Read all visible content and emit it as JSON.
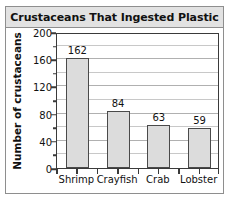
{
  "chart_data": {
    "type": "bar",
    "title": "Crustaceans That Ingested Plastic",
    "xlabel": "",
    "ylabel": "Number of crustaceans",
    "categories": [
      "Shrimp",
      "Crayfish",
      "Crab",
      "Lobster"
    ],
    "values": [
      162,
      84,
      63,
      59
    ],
    "value_labels": [
      "162",
      "84",
      "63",
      "59"
    ],
    "ylim": [
      0,
      200
    ],
    "ytick_values": [
      0,
      40,
      80,
      120,
      160,
      200
    ],
    "ytick_labels": [
      "0",
      "40",
      "80",
      "120",
      "160",
      "200"
    ],
    "minor_tick_step": 20,
    "grid": true,
    "legend": null,
    "bar_fill_color": "#dcdcdc",
    "bar_edge_color": "#4a4a4a",
    "title_band_color": "#e2e2e2",
    "axis_color": "#3a3a3a",
    "grid_color": "#c8c8c8"
  }
}
